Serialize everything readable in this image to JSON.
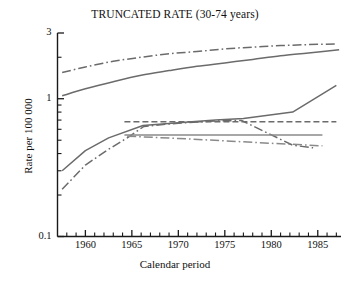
{
  "chart_data": {
    "type": "line",
    "title": "TRUNCATED RATE (30-74 years)",
    "xlabel": "Calendar period",
    "ylabel": "Rate per 100 000",
    "yscale": "log",
    "ylim": [
      0.1,
      3
    ],
    "xlim": [
      1957,
      1987.5
    ],
    "grid": false,
    "legend": "none",
    "xticks": [
      1960,
      1965,
      1970,
      1975,
      1980,
      1985
    ],
    "xtick_labels": [
      "1960",
      "1965",
      "1970",
      "1975",
      "1980",
      "1985"
    ],
    "yticks": [
      0.1,
      1,
      3
    ],
    "ytick_labels": [
      "0.1",
      "1",
      "3"
    ],
    "yminor_ticks": [
      0.2,
      0.3,
      0.4,
      0.5,
      0.6,
      0.7,
      0.8,
      0.9,
      2
    ],
    "series": [
      {
        "name": "series-1-top-dashdot",
        "style": "dashdot",
        "color": "#6b6b6b",
        "x": [
          1957.5,
          1960,
          1963,
          1966,
          1969,
          1972,
          1975,
          1978,
          1981,
          1984,
          1987
        ],
        "y": [
          1.55,
          1.7,
          1.87,
          2.0,
          2.12,
          2.2,
          2.3,
          2.37,
          2.43,
          2.47,
          2.5
        ]
      },
      {
        "name": "series-2-upper-solid",
        "style": "solid",
        "color": "#6b6b6b",
        "x": [
          1957.5,
          1960,
          1963,
          1966,
          1969,
          1972,
          1975,
          1978,
          1981,
          1984,
          1987.3
        ],
        "y": [
          1.05,
          1.18,
          1.33,
          1.48,
          1.6,
          1.72,
          1.82,
          1.93,
          2.05,
          2.15,
          2.27
        ]
      },
      {
        "name": "series-3-rising-solid",
        "style": "solid",
        "color": "#6b6b6b",
        "x": [
          1957.5,
          1960,
          1962.5,
          1966.2,
          1970,
          1974,
          1977,
          1982.3,
          1987
        ],
        "y": [
          0.3,
          0.42,
          0.52,
          0.64,
          0.67,
          0.7,
          0.72,
          0.8,
          1.25
        ]
      },
      {
        "name": "series-4-rising-dashdot",
        "style": "dashdot",
        "color": "#6b6b6b",
        "x": [
          1957.5,
          1960,
          1962.5,
          1964.5,
          1966.3,
          1970,
          1974,
          1976.8,
          1982.3,
          1984.5
        ],
        "y": [
          0.22,
          0.33,
          0.43,
          0.52,
          0.63,
          0.665,
          0.69,
          0.695,
          0.46,
          0.44
        ]
      },
      {
        "name": "series-5-flat-dashed",
        "style": "dashed",
        "color": "#6b6b6b",
        "x": [
          1964.2,
          1970,
          1975,
          1980,
          1987
        ],
        "y": [
          0.68,
          0.68,
          0.68,
          0.68,
          0.68
        ]
      },
      {
        "name": "series-6-flat-solid",
        "style": "solid",
        "color": "#8a8a8a",
        "x": [
          1964.2,
          1970,
          1975,
          1980,
          1985.5
        ],
        "y": [
          0.545,
          0.545,
          0.545,
          0.545,
          0.545
        ]
      },
      {
        "name": "series-7-declining-dashdot",
        "style": "dashdot",
        "color": "#8a8a8a",
        "x": [
          1964.5,
          1970,
          1975,
          1980,
          1985.5
        ],
        "y": [
          0.535,
          0.515,
          0.495,
          0.475,
          0.455
        ]
      }
    ]
  }
}
